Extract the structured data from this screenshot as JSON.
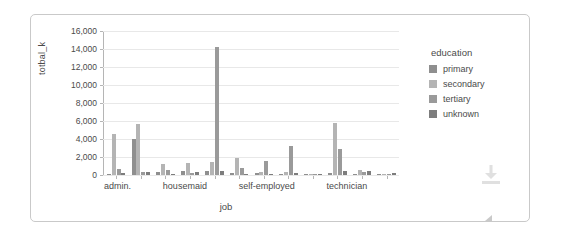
{
  "chart_data": {
    "type": "bar",
    "title": "",
    "xlabel": "job",
    "ylabel": "totbal_k",
    "ylim": [
      0,
      16000
    ],
    "yticks": [
      "0",
      "2,000",
      "4,000",
      "6,000",
      "8,000",
      "10,000",
      "12,000",
      "14,000",
      "16,000"
    ],
    "ytick_values": [
      0,
      2000,
      4000,
      6000,
      8000,
      10000,
      12000,
      14000,
      16000
    ],
    "grid": true,
    "legend_position": "right",
    "legend_title": "education",
    "categories": [
      "admin.",
      "blue-collar",
      "entrepreneur",
      "housemaid",
      "management",
      "retired",
      "self-employed",
      "services",
      "student",
      "technician",
      "unemployed",
      "unknown"
    ],
    "visible_tick_labels": [
      "admin.",
      "",
      "",
      "housemaid",
      "",
      "",
      "self-employed",
      "",
      "",
      "technician",
      "",
      ""
    ],
    "series": [
      {
        "name": "primary",
        "color": "#8f8f8f",
        "values": [
          120,
          4000,
          380,
          420,
          480,
          170,
          200,
          160,
          40,
          190,
          160,
          60
        ]
      },
      {
        "name": "secondary",
        "color": "#b4b4b4",
        "values": [
          4600,
          5620,
          1180,
          1380,
          1420,
          1900,
          320,
          330,
          120,
          5760,
          560,
          70
        ]
      },
      {
        "name": "tertiary",
        "color": "#9a9a9a",
        "values": [
          640,
          330,
          520,
          210,
          14180,
          820,
          1560,
          3180,
          150,
          2880,
          330,
          150
        ]
      },
      {
        "name": "unknown",
        "color": "#7d7d7d",
        "values": [
          260,
          360,
          140,
          380,
          430,
          140,
          120,
          210,
          60,
          400,
          460,
          190
        ]
      }
    ]
  },
  "legend": {
    "title": "education",
    "items": [
      {
        "label": "primary",
        "color": "#8f8f8f"
      },
      {
        "label": "secondary",
        "color": "#b4b4b4"
      },
      {
        "label": "tertiary",
        "color": "#9a9a9a"
      },
      {
        "label": "unknown",
        "color": "#7d7d7d"
      }
    ]
  },
  "icons": {
    "download": "download-icon",
    "resize": "resize-handle-icon"
  }
}
